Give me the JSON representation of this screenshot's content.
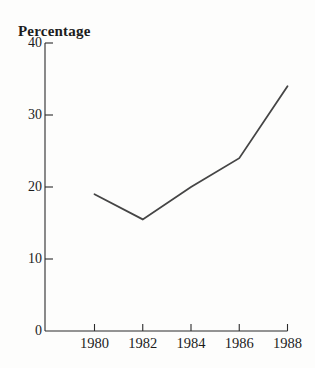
{
  "page": {
    "background": "#fdfdfc"
  },
  "chart_data": {
    "type": "line",
    "title": "Percentage",
    "ylabel": "Percentage",
    "xlabel": "",
    "categories": [
      1980,
      1982,
      1984,
      1986,
      1988
    ],
    "x_tick_labels": [
      "1980",
      "1982",
      "1984",
      "1986",
      "1988"
    ],
    "series": [
      {
        "name": "Percentage",
        "values": [
          19,
          15.5,
          20,
          24,
          34
        ]
      }
    ],
    "ylim": [
      0,
      40
    ],
    "yticks": [
      0,
      10,
      20,
      30,
      40
    ],
    "y_tick_labels": [
      "0",
      "10",
      "20",
      "30",
      "40"
    ],
    "grid": false,
    "legend_position": "none",
    "line_color": "#454545",
    "axis_color": "#2b2b2b",
    "text_color": "#1c1c1c"
  }
}
